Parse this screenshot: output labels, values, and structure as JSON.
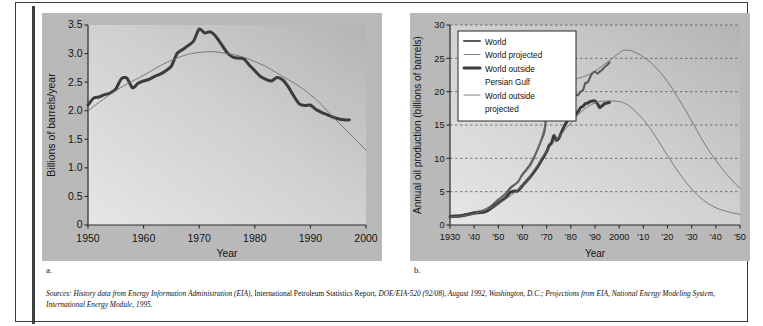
{
  "figure": {
    "panel_a_label": "a.",
    "panel_b_label": "b.",
    "sources": {
      "lead_italic": "Sources: History data from Energy Information Administration (EIA),",
      "roman_1": " International Petroleum Statistics Report,",
      "italic_2": " DOE/EIA-520 (92/08), August 1992, Washington, D.C.; Projections from EIA, National Energy Modeling System, International Energy Module, 1995."
    }
  },
  "colors": {
    "history_line": "#3b3b3b",
    "projected_line": "#6e6e6e",
    "plot_bg_dark": "#b4b4b4",
    "plot_bg_light": "#e6e6e6",
    "axis": "#2b2b2b",
    "grid": "#4a4a4a",
    "frame": "#3a3a3a"
  },
  "chart_data": [
    {
      "id": "panel-a",
      "type": "line",
      "title": "",
      "xlabel": "Year",
      "ylabel": "Billions of barrels/year",
      "xlim": [
        1950,
        2000
      ],
      "ylim": [
        0,
        3.5
      ],
      "xticks": [
        1950,
        1960,
        1970,
        1980,
        1990,
        2000
      ],
      "xticklabels": [
        "1950",
        "1960",
        "1970",
        "1980",
        "1990",
        "2000"
      ],
      "yticks": [
        0,
        0.5,
        1.0,
        1.5,
        2.0,
        2.5,
        3.0,
        3.5
      ],
      "yticklabels": [
        "0",
        "0.5",
        "1.0",
        "1.5",
        "2.0",
        "2.5",
        "3.0",
        "3.5"
      ],
      "grid": false,
      "legend": "none",
      "series": [
        {
          "name": "History",
          "style": "thick",
          "x": [
            1950,
            1951,
            1952,
            1953,
            1954,
            1955,
            1956,
            1957,
            1958,
            1959,
            1960,
            1961,
            1962,
            1963,
            1964,
            1965,
            1966,
            1967,
            1968,
            1969,
            1970,
            1971,
            1972,
            1973,
            1974,
            1975,
            1976,
            1977,
            1978,
            1979,
            1980,
            1981,
            1982,
            1983,
            1984,
            1985,
            1986,
            1987,
            1988,
            1989,
            1990,
            1991,
            1992,
            1993,
            1994,
            1995,
            1996,
            1997
          ],
          "y": [
            2.1,
            2.22,
            2.24,
            2.28,
            2.31,
            2.38,
            2.56,
            2.57,
            2.4,
            2.48,
            2.52,
            2.55,
            2.6,
            2.64,
            2.7,
            2.78,
            3.0,
            3.07,
            3.14,
            3.22,
            3.43,
            3.36,
            3.38,
            3.3,
            3.16,
            3.02,
            2.94,
            2.92,
            2.91,
            2.8,
            2.7,
            2.6,
            2.55,
            2.52,
            2.58,
            2.54,
            2.42,
            2.26,
            2.12,
            2.09,
            2.1,
            2.02,
            1.97,
            1.93,
            1.89,
            1.86,
            1.84,
            1.84
          ]
        },
        {
          "name": "Projected / fitted curve",
          "style": "thin",
          "x": [
            1950,
            1955,
            1960,
            1965,
            1970,
            1975,
            1980,
            1985,
            1990,
            1995,
            2000
          ],
          "y": [
            2.0,
            2.35,
            2.62,
            2.88,
            3.02,
            3.0,
            2.86,
            2.6,
            2.28,
            1.8,
            1.31
          ]
        }
      ]
    },
    {
      "id": "panel-b",
      "type": "line",
      "title": "",
      "xlabel": "Year",
      "ylabel": "Annual oil production (billions of barrels)",
      "xlim": [
        1930,
        2050
      ],
      "ylim": [
        0,
        30
      ],
      "xticks": [
        1930,
        1940,
        1950,
        1960,
        1970,
        1980,
        1990,
        2000,
        2010,
        2020,
        2030,
        2040,
        2050
      ],
      "xticklabels": [
        "1930",
        "'40",
        "'50",
        "'60",
        "'70",
        "'80",
        "'90",
        "2000",
        "'10",
        "'20",
        "'30",
        "'40",
        "'50"
      ],
      "yticks": [
        0,
        5,
        10,
        15,
        20,
        25,
        30
      ],
      "yticklabels": [
        "0",
        "5",
        "10",
        "15",
        "20",
        "25",
        "30"
      ],
      "grid": true,
      "grid_style": "dashed-horizontal",
      "legend": {
        "position": "upper-left",
        "entries": [
          {
            "label": "World",
            "style": "medium"
          },
          {
            "label": "World projected",
            "style": "thin"
          },
          {
            "label": "World outside Persian Gulf",
            "style": "thick"
          },
          {
            "label": "World outside projected",
            "style": "thin"
          }
        ]
      },
      "series": [
        {
          "name": "World",
          "style": "medium",
          "x": [
            1930,
            1935,
            1940,
            1945,
            1950,
            1953,
            1955,
            1958,
            1960,
            1963,
            1965,
            1967,
            1968,
            1969,
            1970,
            1971,
            1972,
            1973,
            1974,
            1975,
            1976,
            1977,
            1978,
            1979,
            1980,
            1981,
            1982,
            1983,
            1984,
            1985,
            1986,
            1987,
            1988,
            1989,
            1990,
            1991,
            1992,
            1993,
            1994,
            1995,
            1996
          ],
          "y": [
            1.35,
            1.5,
            1.9,
            2.25,
            3.8,
            4.7,
            5.6,
            6.4,
            7.6,
            9.0,
            10.3,
            12.0,
            12.9,
            13.9,
            16.7,
            17.6,
            18.6,
            20.4,
            20.5,
            19.5,
            21.2,
            22.0,
            22.6,
            23.3,
            21.8,
            20.3,
            19.6,
            19.5,
            20.0,
            20.2,
            21.3,
            21.4,
            22.2,
            22.8,
            23.0,
            22.7,
            23.0,
            23.3,
            23.7,
            24.0,
            24.4
          ]
        },
        {
          "name": "World projected",
          "style": "thin",
          "x": [
            1930,
            1940,
            1950,
            1960,
            1965,
            1970,
            1973,
            1976,
            1980,
            1985,
            1990,
            1995,
            2000,
            2002,
            2004,
            2006,
            2010,
            2015,
            2020,
            2025,
            2030,
            2035,
            2040,
            2045,
            2050
          ],
          "y": [
            1.3,
            1.85,
            3.7,
            7.4,
            10.1,
            15.8,
            19.5,
            21.0,
            21.8,
            22.2,
            23.1,
            24.4,
            25.8,
            26.2,
            26.2,
            26.0,
            25.2,
            23.7,
            21.5,
            18.7,
            15.6,
            12.4,
            9.7,
            7.4,
            5.5
          ]
        },
        {
          "name": "World outside Persian Gulf",
          "style": "thick",
          "x": [
            1930,
            1935,
            1940,
            1945,
            1950,
            1953,
            1955,
            1957,
            1958,
            1960,
            1962,
            1964,
            1966,
            1968,
            1970,
            1971,
            1972,
            1973,
            1974,
            1975,
            1976,
            1977,
            1978,
            1979,
            1980,
            1981,
            1982,
            1983,
            1984,
            1985,
            1986,
            1987,
            1988,
            1989,
            1990,
            1991,
            1992,
            1993,
            1994,
            1995,
            1996
          ],
          "y": [
            1.25,
            1.4,
            1.75,
            2.05,
            3.3,
            4.1,
            4.9,
            5.1,
            5.1,
            5.9,
            6.7,
            7.6,
            8.6,
            9.8,
            11.0,
            11.9,
            12.3,
            13.4,
            12.7,
            13.0,
            13.8,
            14.6,
            15.3,
            15.8,
            15.9,
            16.2,
            16.6,
            17.0,
            17.6,
            17.8,
            18.2,
            18.3,
            18.5,
            18.6,
            18.6,
            18.2,
            17.6,
            17.9,
            18.2,
            18.3,
            18.4
          ]
        },
        {
          "name": "World outside projected",
          "style": "thin",
          "x": [
            1930,
            1940,
            1950,
            1960,
            1965,
            1970,
            1975,
            1980,
            1985,
            1990,
            1995,
            2000,
            2002,
            2005,
            2010,
            2015,
            2020,
            2025,
            2030,
            2035,
            2040,
            2045,
            2050
          ],
          "y": [
            1.2,
            1.7,
            3.2,
            5.9,
            8.3,
            11.1,
            13.2,
            15.3,
            17.2,
            18.3,
            18.6,
            18.5,
            18.3,
            17.6,
            15.8,
            13.3,
            10.4,
            7.7,
            5.4,
            3.7,
            2.6,
            2.0,
            1.6
          ]
        }
      ]
    }
  ]
}
